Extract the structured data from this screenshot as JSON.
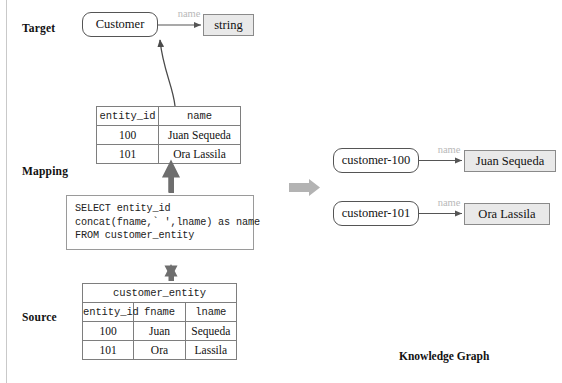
{
  "sections": {
    "target_label": "Target",
    "mapping_label": "Mapping",
    "source_label": "Source",
    "kg_caption": "Knowledge Graph"
  },
  "target": {
    "class_node": "Customer",
    "edge_label": "name",
    "datatype_node": "string"
  },
  "mapping": {
    "result_table": {
      "headers": [
        "entity_id",
        "name"
      ],
      "rows": [
        [
          "100",
          "Juan Sequeda"
        ],
        [
          "101",
          "Ora Lassila"
        ]
      ]
    },
    "sql": {
      "lines": [
        "SELECT entity_id",
        "concat(fname,` ',lname) as name",
        "FROM customer_entity"
      ]
    }
  },
  "source": {
    "table": {
      "title": "customer_entity",
      "headers": [
        "entity_id",
        "fname",
        "lname"
      ],
      "rows": [
        [
          "100",
          "Juan",
          "Sequeda"
        ],
        [
          "101",
          "Ora",
          "Lassila"
        ]
      ]
    }
  },
  "knowledge_graph": {
    "triples": [
      {
        "subject": "customer-100",
        "predicate": "name",
        "object": "Juan Sequeda"
      },
      {
        "subject": "customer-101",
        "predicate": "name",
        "object": "Ora Lassila"
      }
    ]
  },
  "colors": {
    "literal_fill": "#e9e9e9",
    "edge_label": "#b9b9b9",
    "block_arrow": "#b3b3b3",
    "vertical_arrow": "#6e6e6e",
    "line": "#555555"
  }
}
